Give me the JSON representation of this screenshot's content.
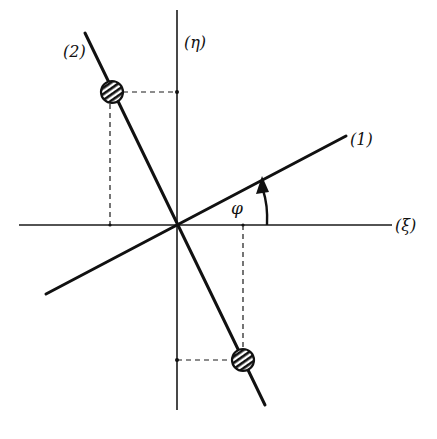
{
  "diagram": {
    "labels": {
      "eta_axis": "(η)",
      "xi_axis": "(ξ)",
      "line1": "(1)",
      "line2": "(2)",
      "angle": "φ"
    },
    "colors": {
      "ink": "#111111",
      "background": "#ffffff"
    },
    "geometry": {
      "origin": [
        177,
        225
      ],
      "xi_axis": {
        "x1": 19,
        "y1": 225,
        "x2": 392,
        "y2": 225
      },
      "eta_axis": {
        "x1": 177,
        "y1": 10,
        "x2": 177,
        "y2": 410
      },
      "line1": {
        "x1": 46,
        "y1": 294,
        "x2": 346,
        "y2": 136
      },
      "line2": {
        "x1": 85,
        "y1": 33,
        "x2": 265,
        "y2": 405
      },
      "point_top": {
        "cx": 112,
        "cy": 92,
        "r": 11
      },
      "point_bottom": {
        "cx": 243,
        "cy": 360,
        "r": 11
      }
    }
  }
}
